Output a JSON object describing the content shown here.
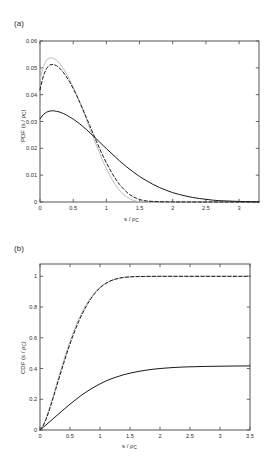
{
  "figure": {
    "background": "#ffffff",
    "panels": [
      {
        "id": "a",
        "label": "(a)"
      },
      {
        "id": "b",
        "label": "(b)"
      }
    ]
  },
  "axis_styling": {
    "frame_color": "#555555",
    "tick_color": "#555555",
    "tick_label_color": "#2b2b2b"
  },
  "series_styling": {
    "gray_solid_color": "#bdbdbd",
    "black_dashed_color": "#1a1a1a",
    "black_solid_color": "#1a1a1a"
  },
  "chart_data": [
    {
      "type": "line",
      "panel": "a",
      "title": "",
      "xlabel": "s / ρc",
      "xlabel_main": "s / ρ",
      "xlabel_sub": "C",
      "ylabel": "PDF (s / ρc)",
      "ylabel_main": "PDF (s / ρ",
      "ylabel_sub": "C",
      "ylabel_tail": ")",
      "xlim": [
        0,
        3.3
      ],
      "ylim": [
        0,
        0.06
      ],
      "xticks": [
        0,
        0.5,
        1,
        1.5,
        2,
        2.5,
        3
      ],
      "xticklabels": [
        "0",
        "0.5",
        "1",
        "1.5",
        "2",
        "2.5",
        "3"
      ],
      "yticks": [
        0,
        0.01,
        0.02,
        0.03,
        0.04,
        0.05,
        0.06
      ],
      "yticklabels": [
        "0",
        "0.01",
        "0.02",
        "0.03",
        "0.04",
        "0.05",
        "0.06"
      ],
      "grid": false,
      "legend": "none",
      "series": [
        {
          "name": "gray-solid",
          "style": "solid",
          "color": "#bdbdbd",
          "x": [
            0,
            0.05,
            0.1,
            0.15,
            0.2,
            0.25,
            0.3,
            0.35,
            0.4,
            0.45,
            0.5,
            0.55,
            0.6,
            0.65,
            0.7,
            0.75,
            0.8,
            0.85,
            0.9,
            0.95,
            1.0,
            1.05,
            1.1,
            1.15,
            1.2,
            1.25,
            1.3,
            1.35,
            1.4,
            1.45,
            1.5,
            1.6,
            1.8,
            2.2,
            2.8,
            3.3
          ],
          "y": [
            0.0455,
            0.0505,
            0.0529,
            0.0537,
            0.0536,
            0.0528,
            0.0515,
            0.0498,
            0.0478,
            0.0455,
            0.0429,
            0.0401,
            0.0371,
            0.034,
            0.0308,
            0.0275,
            0.0243,
            0.0211,
            0.018,
            0.0151,
            0.0124,
            0.01,
            0.0078,
            0.0059,
            0.0043,
            0.003,
            0.002,
            0.0012,
            0.0007,
            0.0003,
            0.0001,
            2e-05,
            0.0,
            0.0,
            0.0,
            0.0
          ]
        },
        {
          "name": "black-dashed",
          "style": "dashed",
          "color": "#1a1a1a",
          "x": [
            0,
            0.05,
            0.1,
            0.15,
            0.2,
            0.25,
            0.3,
            0.35,
            0.4,
            0.45,
            0.5,
            0.55,
            0.6,
            0.65,
            0.7,
            0.75,
            0.8,
            0.85,
            0.9,
            0.95,
            1.0,
            1.05,
            1.1,
            1.15,
            1.2,
            1.25,
            1.3,
            1.35,
            1.4,
            1.45,
            1.5,
            1.55,
            1.6,
            1.7,
            1.8,
            2.0,
            2.4,
            3.0,
            3.3
          ],
          "y": [
            0.0418,
            0.047,
            0.0499,
            0.0511,
            0.0513,
            0.0508,
            0.0498,
            0.0484,
            0.0466,
            0.0446,
            0.0423,
            0.0398,
            0.0371,
            0.0343,
            0.0314,
            0.0285,
            0.0255,
            0.0226,
            0.0198,
            0.0171,
            0.0146,
            0.0123,
            0.0101,
            0.0082,
            0.0065,
            0.0051,
            0.0038,
            0.0028,
            0.002,
            0.0014,
            0.0009,
            0.0006,
            0.0004,
            0.0002,
            0.0001,
            2e-05,
            0.0,
            0.0,
            0.0
          ]
        },
        {
          "name": "black-solid",
          "style": "solid",
          "color": "#1a1a1a",
          "x": [
            0,
            0.05,
            0.1,
            0.15,
            0.2,
            0.25,
            0.3,
            0.35,
            0.4,
            0.5,
            0.6,
            0.7,
            0.8,
            0.9,
            1.0,
            1.1,
            1.2,
            1.3,
            1.4,
            1.5,
            1.6,
            1.7,
            1.8,
            1.9,
            2.0,
            2.1,
            2.2,
            2.3,
            2.4,
            2.5,
            2.6,
            2.7,
            2.8,
            2.9,
            3.0,
            3.1,
            3.2,
            3.3
          ],
          "y": [
            0.031,
            0.0326,
            0.0335,
            0.0339,
            0.034,
            0.0338,
            0.0335,
            0.033,
            0.0324,
            0.0309,
            0.0291,
            0.027,
            0.0247,
            0.0223,
            0.0199,
            0.0176,
            0.0153,
            0.0132,
            0.0113,
            0.0095,
            0.008,
            0.0066,
            0.0054,
            0.0044,
            0.0035,
            0.0028,
            0.0022,
            0.0017,
            0.0013,
            0.001,
            0.0007,
            0.0005,
            0.0004,
            0.0003,
            0.0002,
            0.00015,
            0.0001,
            5e-05
          ]
        }
      ]
    },
    {
      "type": "line",
      "panel": "b",
      "title": "",
      "xlabel": "s / ρc",
      "xlabel_main": "s / ρ",
      "xlabel_sub": "C",
      "ylabel": "CDF (s / ρc)",
      "ylabel_main": "CDF (s / ρ",
      "ylabel_sub": "C",
      "ylabel_tail": ")",
      "xlim": [
        0,
        3.5
      ],
      "ylim": [
        0,
        1.08
      ],
      "xticks": [
        0,
        0.5,
        1,
        1.5,
        2,
        2.5,
        3,
        3.5
      ],
      "xticklabels": [
        "0",
        "0.5",
        "1",
        "1.5",
        "2",
        "2.5",
        "3",
        "3.5"
      ],
      "yticks": [
        0,
        0.2,
        0.4,
        0.6,
        0.8,
        1
      ],
      "yticklabels": [
        "0",
        "0.2",
        "0.4",
        "0.6",
        "0.8",
        "1"
      ],
      "grid": false,
      "legend": "none",
      "series": [
        {
          "name": "gray-solid",
          "style": "solid",
          "color": "#bdbdbd",
          "x": [
            0,
            0.05,
            0.1,
            0.15,
            0.2,
            0.25,
            0.3,
            0.35,
            0.4,
            0.45,
            0.5,
            0.55,
            0.6,
            0.65,
            0.7,
            0.75,
            0.8,
            0.85,
            0.9,
            0.95,
            1.0,
            1.05,
            1.1,
            1.15,
            1.2,
            1.3,
            1.4,
            1.5,
            1.8,
            2.2,
            2.8,
            3.5
          ],
          "y": [
            0,
            0.028,
            0.075,
            0.133,
            0.197,
            0.263,
            0.33,
            0.395,
            0.459,
            0.52,
            0.577,
            0.631,
            0.68,
            0.725,
            0.766,
            0.803,
            0.836,
            0.865,
            0.89,
            0.912,
            0.93,
            0.945,
            0.957,
            0.967,
            0.975,
            0.987,
            0.994,
            0.997,
            0.9995,
            1.0,
            1.0,
            1.0
          ]
        },
        {
          "name": "black-dashed",
          "style": "dashed",
          "color": "#1a1a1a",
          "x": [
            0,
            0.05,
            0.1,
            0.15,
            0.2,
            0.25,
            0.3,
            0.35,
            0.4,
            0.45,
            0.5,
            0.55,
            0.6,
            0.65,
            0.7,
            0.75,
            0.8,
            0.85,
            0.9,
            0.95,
            1.0,
            1.05,
            1.1,
            1.15,
            1.2,
            1.3,
            1.4,
            1.5,
            1.6,
            1.8,
            2.0,
            2.4,
            3.0,
            3.5
          ],
          "y": [
            0,
            0.025,
            0.068,
            0.123,
            0.184,
            0.248,
            0.314,
            0.378,
            0.441,
            0.502,
            0.56,
            0.614,
            0.664,
            0.711,
            0.753,
            0.791,
            0.825,
            0.856,
            0.882,
            0.905,
            0.925,
            0.941,
            0.954,
            0.965,
            0.974,
            0.986,
            0.993,
            0.996,
            0.998,
            0.9995,
            1.0,
            1.0,
            1.0,
            1.0
          ]
        },
        {
          "name": "black-solid",
          "style": "solid",
          "color": "#1a1a1a",
          "x": [
            0,
            0.05,
            0.1,
            0.15,
            0.2,
            0.25,
            0.3,
            0.4,
            0.5,
            0.6,
            0.7,
            0.8,
            0.9,
            1.0,
            1.1,
            1.2,
            1.3,
            1.4,
            1.5,
            1.6,
            1.7,
            1.8,
            1.9,
            2.0,
            2.2,
            2.4,
            2.6,
            2.8,
            3.0,
            3.2,
            3.5
          ],
          "y": [
            0,
            0.016,
            0.033,
            0.05,
            0.067,
            0.084,
            0.101,
            0.135,
            0.168,
            0.199,
            0.229,
            0.255,
            0.279,
            0.3,
            0.319,
            0.335,
            0.348,
            0.36,
            0.37,
            0.378,
            0.385,
            0.391,
            0.396,
            0.4,
            0.406,
            0.41,
            0.412,
            0.414,
            0.415,
            0.416,
            0.417
          ]
        }
      ]
    }
  ]
}
